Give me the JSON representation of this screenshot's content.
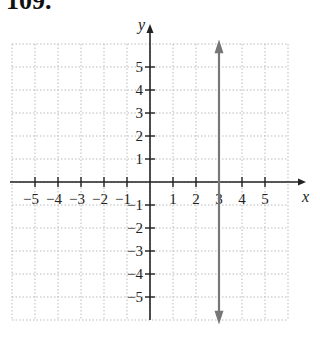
{
  "problem": {
    "number": "109."
  },
  "chart_data": {
    "type": "line",
    "title": "",
    "xlabel": "x",
    "ylabel": "y",
    "xlim": [
      -6,
      6
    ],
    "ylim": [
      -6,
      6
    ],
    "grid": true,
    "x_tick_labels": [
      "−5",
      "−4",
      "−3",
      "−2",
      "−1",
      "1",
      "2",
      "3",
      "4",
      "5"
    ],
    "y_tick_labels": [
      "5",
      "4",
      "3",
      "2",
      "1",
      "−1",
      "−2",
      "−3",
      "−4",
      "−5"
    ],
    "series": [
      {
        "name": "x = 3",
        "type": "vertical-line",
        "x": 3,
        "arrows": "both",
        "color": "#777777"
      }
    ]
  }
}
